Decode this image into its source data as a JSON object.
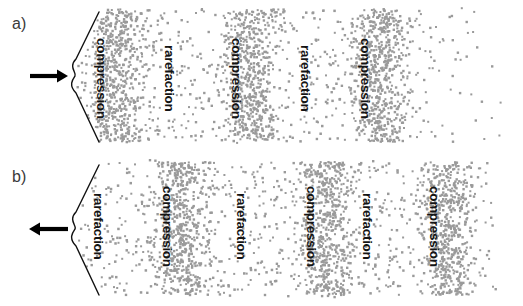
{
  "figure": {
    "width": 523,
    "height": 306,
    "background": "#ffffff",
    "dot_color": "#9a9a9a",
    "label_color": "#141414",
    "line_color": "#111111",
    "panel_label_color": "#3a3a3a"
  },
  "panels": [
    {
      "id": "panel-a",
      "label": "a)",
      "arrow_direction": "right",
      "arrow_meaning": "source moving toward observer",
      "wedge": {
        "apex_x": 70,
        "apex_y": 76,
        "top_x": 99,
        "top_y": 12,
        "bottom_x": 99,
        "bottom_y": 142
      },
      "bands": [
        {
          "type": "compression",
          "label": "compression",
          "x": 108,
          "label_y": 38
        },
        {
          "type": "rarefaction",
          "label": "rarefaction",
          "x": 176,
          "label_y": 45
        },
        {
          "type": "compression",
          "label": "compression",
          "x": 243,
          "label_y": 38
        },
        {
          "type": "rarefaction",
          "label": "rarefaction",
          "x": 312,
          "label_y": 45
        },
        {
          "type": "compression",
          "label": "compression",
          "x": 372,
          "label_y": 38
        }
      ]
    },
    {
      "id": "panel-b",
      "label": "b)",
      "arrow_direction": "left",
      "arrow_meaning": "source moving away from observer",
      "wedge": {
        "apex_x": 70,
        "apex_y": 76,
        "top_x": 99,
        "top_y": 12,
        "bottom_x": 99,
        "bottom_y": 142
      },
      "bands": [
        {
          "type": "rarefaction",
          "label": "rarefaction",
          "x": 105,
          "label_y": 40
        },
        {
          "type": "compression",
          "label": "compression",
          "x": 174,
          "label_y": 33
        },
        {
          "type": "rarefaction",
          "label": "rarefaction",
          "x": 248,
          "label_y": 40
        },
        {
          "type": "compression",
          "label": "compression",
          "x": 318,
          "label_y": 33
        },
        {
          "type": "rarefaction",
          "label": "rarefaction",
          "x": 374,
          "label_y": 40
        },
        {
          "type": "compression",
          "label": "compression",
          "x": 441,
          "label_y": 33
        }
      ]
    }
  ],
  "chart_data": {
    "type": "scatter",
    "title": "",
    "xlabel": "",
    "ylabel": "",
    "xlim": [
      0,
      523
    ],
    "ylim": [
      0,
      153
    ],
    "grid": false,
    "legend": "none",
    "series": [
      {
        "name": "panel-a-particles",
        "bands": [
          {
            "center": 112,
            "sigma": 15,
            "density": "high",
            "label": "compression"
          },
          {
            "center": 178,
            "sigma": 22,
            "density": "low",
            "label": "rarefaction"
          },
          {
            "center": 246,
            "sigma": 15,
            "density": "high",
            "label": "compression"
          },
          {
            "center": 314,
            "sigma": 22,
            "density": "low",
            "label": "rarefaction"
          },
          {
            "center": 376,
            "sigma": 16,
            "density": "high",
            "label": "compression"
          }
        ]
      },
      {
        "name": "panel-b-particles",
        "bands": [
          {
            "center": 112,
            "sigma": 22,
            "density": "low",
            "label": "rarefaction"
          },
          {
            "center": 178,
            "sigma": 16,
            "density": "high",
            "label": "compression"
          },
          {
            "center": 252,
            "sigma": 22,
            "density": "low",
            "label": "rarefaction"
          },
          {
            "center": 322,
            "sigma": 16,
            "density": "high",
            "label": "compression"
          },
          {
            "center": 378,
            "sigma": 20,
            "density": "low",
            "label": "rarefaction"
          },
          {
            "center": 445,
            "sigma": 16,
            "density": "high",
            "label": "compression"
          }
        ]
      }
    ]
  }
}
